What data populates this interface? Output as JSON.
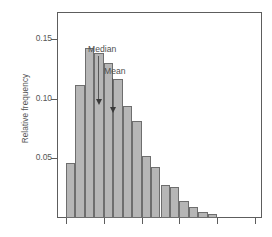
{
  "chart_data": {
    "type": "bar",
    "title": "",
    "subtitle": "",
    "xlabel": "",
    "ylabel": "Relative frequency",
    "ylim": [
      0,
      0.1725
    ],
    "xlim": [
      0,
      16
    ],
    "grid": false,
    "legend": null,
    "ytick_labels": [
      "0.05",
      "0.10",
      "0.15"
    ],
    "ytick_values": [
      0.05,
      0.1,
      0.15
    ],
    "xtick_labels": [
      "",
      "",
      "",
      "",
      "",
      ""
    ],
    "xtick_positions": [
      1,
      5,
      9,
      13,
      17,
      21
    ],
    "bar_color": "#b6b6b6",
    "bar_edge_color": "#6e6e6e",
    "axis_color": "#5d5d5d",
    "categories": [
      "1",
      "2",
      "3",
      "4",
      "5",
      "6",
      "7",
      "8",
      "9",
      "10",
      "11",
      "12",
      "13",
      "14",
      "15",
      "16"
    ],
    "values": [
      0.046,
      0.111,
      0.142,
      0.138,
      0.13,
      0.116,
      0.094,
      0.081,
      0.052,
      0.043,
      0.028,
      0.026,
      0.014,
      0.009,
      0.005,
      0.003
    ],
    "annotations": [
      {
        "text": "Median",
        "label_x": 88,
        "label_y": 44,
        "arrow_x": 98,
        "arrow_top": 56,
        "arrow_length": 44
      },
      {
        "text": "Mean",
        "label_x": 104,
        "label_y": 66,
        "arrow_x": 112,
        "arrow_top": 78,
        "arrow_length": 30
      }
    ]
  }
}
